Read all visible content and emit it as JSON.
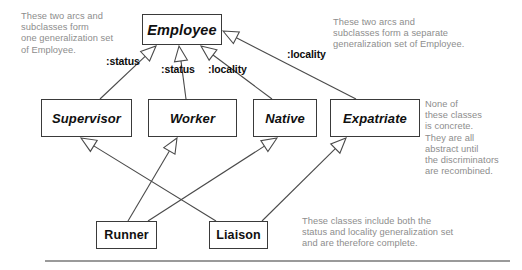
{
  "diagram": {
    "classes": [
      {
        "id": "employee",
        "name": "Employee",
        "x": 142,
        "y": 14,
        "w": 80,
        "h": 31,
        "font": 14.5,
        "abstract": true
      },
      {
        "id": "supervisor",
        "name": "Supervisor",
        "x": 41,
        "y": 99,
        "w": 91,
        "h": 38,
        "font": 13,
        "abstract": true
      },
      {
        "id": "worker",
        "name": "Worker",
        "x": 148,
        "y": 99,
        "w": 89,
        "h": 38,
        "font": 13,
        "abstract": true
      },
      {
        "id": "native",
        "name": "Native",
        "x": 253,
        "y": 99,
        "w": 64,
        "h": 38,
        "font": 13,
        "abstract": true
      },
      {
        "id": "expatriate",
        "name": "Expatriate",
        "x": 330,
        "y": 99,
        "w": 90,
        "h": 38,
        "font": 13,
        "abstract": true
      },
      {
        "id": "runner",
        "name": "Runner",
        "x": 96,
        "y": 221,
        "w": 61,
        "h": 28,
        "font": 12.5,
        "abstract": false
      },
      {
        "id": "liaison",
        "name": "Liaison",
        "x": 209,
        "y": 221,
        "w": 59,
        "h": 28,
        "font": 12.5,
        "abstract": false
      }
    ],
    "discriminator_labels": [
      {
        "id": "status-supervisor",
        "text": ":status",
        "x": 106,
        "y": 55
      },
      {
        "id": "status-worker",
        "text": ":status",
        "x": 161,
        "y": 63
      },
      {
        "id": "locality-native",
        "text": ":locality",
        "x": 208,
        "y": 63
      },
      {
        "id": "locality-expat",
        "text": ":locality",
        "x": 287,
        "y": 48
      }
    ],
    "generalizations": [
      {
        "id": "supervisor-to-employee",
        "from": "supervisor",
        "to": "employee",
        "set": ":status",
        "x1": 100,
        "y1": 99,
        "x2": 156,
        "y2": 46
      },
      {
        "id": "worker-to-employee",
        "from": "worker",
        "to": "employee",
        "set": ":status",
        "x1": 186,
        "y1": 99,
        "x2": 179,
        "y2": 46
      },
      {
        "id": "native-to-employee",
        "from": "native",
        "to": "employee",
        "set": ":locality",
        "x1": 272,
        "y1": 99,
        "x2": 201,
        "y2": 46
      },
      {
        "id": "expatriate-to-employee",
        "from": "expatriate",
        "to": "employee",
        "set": ":locality",
        "x1": 356,
        "y1": 99,
        "x2": 223,
        "y2": 31
      },
      {
        "id": "runner-to-worker",
        "from": "runner",
        "to": "worker",
        "set": ":status",
        "x1": 128,
        "y1": 221,
        "x2": 177,
        "y2": 138
      },
      {
        "id": "runner-to-native",
        "from": "runner",
        "to": "native",
        "set": ":locality",
        "x1": 148,
        "y1": 221,
        "x2": 277,
        "y2": 138
      },
      {
        "id": "liaison-to-supervisor",
        "from": "liaison",
        "to": "supervisor",
        "set": ":status",
        "x1": 216,
        "y1": 221,
        "x2": 81,
        "y2": 138
      },
      {
        "id": "liaison-to-expatriate",
        "from": "liaison",
        "to": "expatriate",
        "set": ":locality",
        "x1": 262,
        "y1": 221,
        "x2": 346,
        "y2": 138
      }
    ],
    "notes": [
      {
        "id": "note-left",
        "x": 21,
        "y": 11,
        "text": "These two arcs and\nsubclasses form\none generalization set\nof Employee."
      },
      {
        "id": "note-right-top",
        "x": 333,
        "y": 17,
        "text": "These two arcs and\nsubclasses form a separate\ngeneralization set of Employee."
      },
      {
        "id": "note-abstract",
        "x": 425,
        "y": 99,
        "text": "None of\nthese classes\nis concrete.\nThey are all\nabstract until\nthe discriminators\nare recombined."
      },
      {
        "id": "note-complete",
        "x": 302,
        "y": 216,
        "text": "These classes include both the\nstatus and locality generalization set\nand are therefore complete."
      }
    ],
    "divider": {
      "id": "bottom-rule",
      "x": 45,
      "y": 260,
      "w": 465
    },
    "colors": {
      "box_border": "#3a3a3a",
      "line": "#4a4a4a",
      "note_text": "#8d8d8d",
      "class_text": "#101010",
      "rule": "#9a9a9a",
      "background": "#ffffff"
    }
  }
}
